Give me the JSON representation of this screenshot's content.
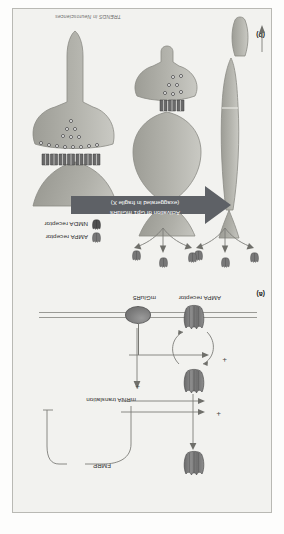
{
  "figure": {
    "journal_watermark": "TRENDS in Neurosciences",
    "panel_a": {
      "letter": "(a)",
      "labels": {
        "mglur5": "mGluR5",
        "ampa_receptor": "AMPA receptor",
        "mrna_translation": "mRNA translation",
        "fmrp": "FMRP",
        "plus_1": "+",
        "plus_2": "+",
        "plus_3": "+",
        "plus_4": "+"
      }
    },
    "panel_b": {
      "letter": "(b)",
      "big_arrow_text_line1": "Activation of Gp1 mGluRs",
      "big_arrow_text_line2": "(exaggerated in fragile X)",
      "legend": [
        {
          "icon": "ampa-receptor-icon",
          "label": "AMPA receptor"
        },
        {
          "icon": "nmda-receptor-icon",
          "label": "NMDA receptor"
        }
      ]
    }
  },
  "colors": {
    "figure_background": "#f2f2ef",
    "figure_border": "#b9b9b4",
    "arrow_banner": "#5e6166",
    "arrow_banner_text": "#ffffff",
    "spine_fill": "#b4b4ae",
    "spine_stroke": "#8a8a84",
    "receptor_dark": "#6c6c6c",
    "vesicle_fill": "#fbfbfb",
    "line_gray": "#7d7d78",
    "text": "#2b2b2b"
  }
}
